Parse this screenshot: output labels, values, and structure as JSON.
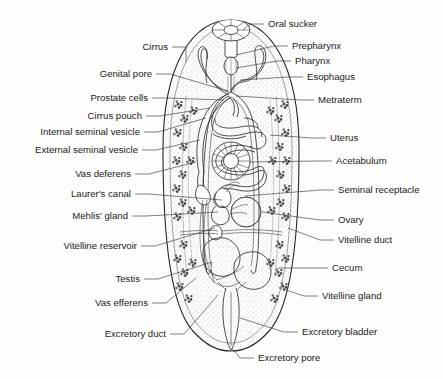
{
  "figure": {
    "style": "black-and-white stippled line drawing",
    "background_color": "#ffffff",
    "ink_color": "#1b1b1b"
  },
  "labels_left": [
    {
      "id": "cirrus",
      "text": "Cirrus",
      "x": 168,
      "y": 47,
      "lx": 186,
      "ly": 62
    },
    {
      "id": "genital-pore",
      "text": "Genital pore",
      "x": 152,
      "y": 74,
      "lx": 228,
      "ly": 91
    },
    {
      "id": "prostate-cells",
      "text": "Prostate cells",
      "x": 148,
      "y": 98,
      "lx": 224,
      "ly": 100
    },
    {
      "id": "cirrus-pouch",
      "text": "Cirrus pouch",
      "x": 142,
      "y": 116,
      "lx": 210,
      "ly": 108
    },
    {
      "id": "internal-seminal-vesicle",
      "text": "Internal seminal vesicle",
      "x": 140,
      "y": 132,
      "lx": 206,
      "ly": 118
    },
    {
      "id": "external-seminal-vesicle",
      "text": "External seminal vesicle",
      "x": 138,
      "y": 150,
      "lx": 200,
      "ly": 140
    },
    {
      "id": "vas-deferens",
      "text": "Vas deferens",
      "x": 131,
      "y": 174,
      "lx": 196,
      "ly": 162
    },
    {
      "id": "laurers-canal",
      "text": "Laurer's canal",
      "x": 131,
      "y": 194,
      "lx": 222,
      "ly": 200
    },
    {
      "id": "mehlis-gland",
      "text": "Mehlis' gland",
      "x": 128,
      "y": 216,
      "lx": 218,
      "ly": 212
    },
    {
      "id": "vitelline-reservoir",
      "text": "Vitelline reservoir",
      "x": 137,
      "y": 246,
      "lx": 215,
      "ly": 228
    },
    {
      "id": "testis",
      "text": "Testis",
      "x": 140,
      "y": 279,
      "lx": 212,
      "ly": 262
    },
    {
      "id": "vas-efferens",
      "text": "Vas efferens",
      "x": 148,
      "y": 303,
      "lx": 196,
      "ly": 278
    },
    {
      "id": "excretory-duct",
      "text": "Excretory duct",
      "x": 166,
      "y": 334,
      "lx": 218,
      "ly": 295
    }
  ],
  "labels_right": [
    {
      "id": "oral-sucker",
      "text": "Oral sucker",
      "x": 268,
      "y": 24,
      "lx": 243,
      "ly": 30
    },
    {
      "id": "prepharynx",
      "text": "Prepharynx",
      "x": 292,
      "y": 46,
      "lx": 236,
      "ly": 55
    },
    {
      "id": "pharynx",
      "text": "Pharynx",
      "x": 295,
      "y": 61,
      "lx": 236,
      "ly": 68
    },
    {
      "id": "esophagus",
      "text": "Esophagus",
      "x": 307,
      "y": 77,
      "lx": 240,
      "ly": 80
    },
    {
      "id": "metraterm",
      "text": "Metraterm",
      "x": 318,
      "y": 100,
      "lx": 236,
      "ly": 96
    },
    {
      "id": "uterus",
      "text": "Uterus",
      "x": 330,
      "y": 138,
      "lx": 270,
      "ly": 135
    },
    {
      "id": "acetabulum",
      "text": "Acetabulum",
      "x": 336,
      "y": 161,
      "lx": 250,
      "ly": 162
    },
    {
      "id": "seminal-receptacle",
      "text": "Seminal receptacle",
      "x": 338,
      "y": 190,
      "lx": 245,
      "ly": 196
    },
    {
      "id": "ovary",
      "text": "Ovary",
      "x": 338,
      "y": 220,
      "lx": 262,
      "ly": 212
    },
    {
      "id": "vitelline-duct",
      "text": "Vitelline duct",
      "x": 338,
      "y": 240,
      "lx": 288,
      "ly": 228
    },
    {
      "id": "cecum",
      "text": "Cecum",
      "x": 332,
      "y": 268,
      "lx": 278,
      "ly": 268
    },
    {
      "id": "vitelline-gland",
      "text": "Vitelline gland",
      "x": 322,
      "y": 296,
      "lx": 286,
      "ly": 290
    },
    {
      "id": "excretory-bladder",
      "text": "Excretory bladder",
      "x": 302,
      "y": 332,
      "lx": 240,
      "ly": 318
    },
    {
      "id": "excretory-pore",
      "text": "Excretory pore",
      "x": 258,
      "y": 358,
      "lx": 232,
      "ly": 348
    }
  ],
  "structures": {
    "body_outline": "elongated oval, apex at top, rounded posterior",
    "oral_sucker": "radially spoked ellipse at anterior tip",
    "acetabulum": "radially spoked circle at body center",
    "ovary": "stippled sphere below acetabulum, right of midline",
    "seminal_receptacle": "small rounded lobe left of ovary",
    "testes": "two large stippled ovoid bodies in posterior third",
    "uterus": "coiled tubular loops filling mid-body",
    "ceca": "paired intestinal tubes running down both sides",
    "vitelline_glands": "clustered follicles along both lateral margins",
    "excretory_bladder": "narrow sac on midline at posterior end"
  }
}
